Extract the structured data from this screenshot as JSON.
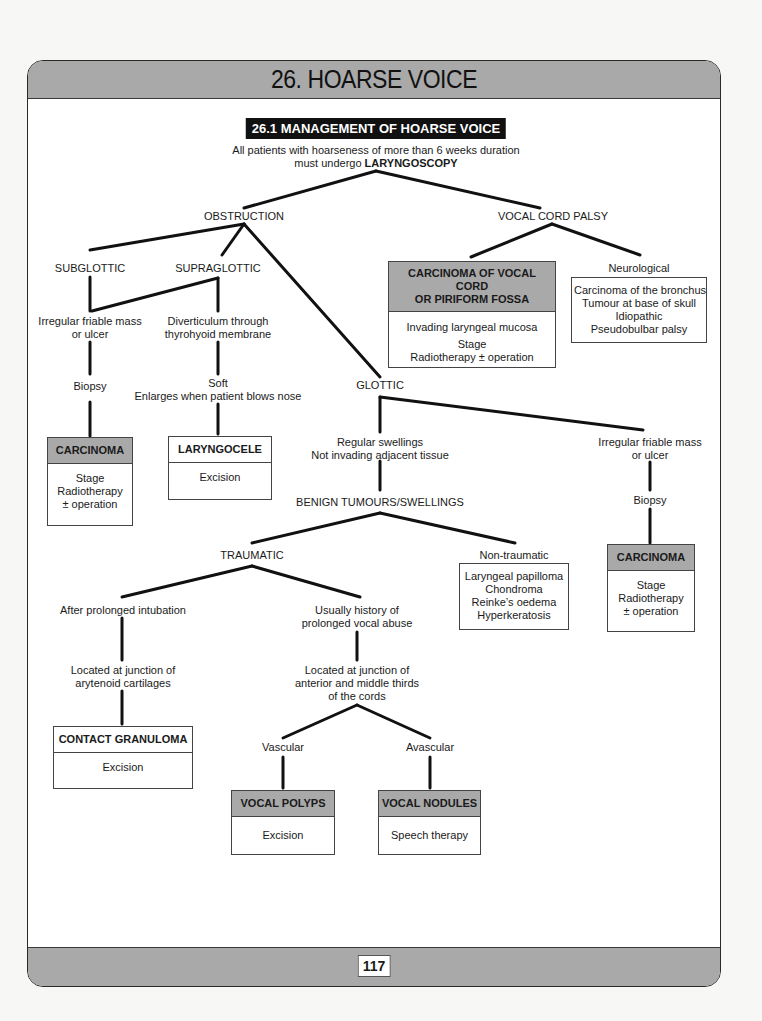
{
  "page": {
    "chapter_title": "26. HOARSE VOICE",
    "page_number": "117"
  },
  "section": {
    "title": "26.1 MANAGEMENT OF HOARSE VOICE",
    "intro_line1": "All patients with hoarseness of more than 6 weeks duration",
    "intro_line2_prefix": "must undergo ",
    "intro_line2_keyword": "LARYNGOSCOPY"
  },
  "nodes": {
    "obstruction": "OBSTRUCTION",
    "vocal_cord_palsy": "VOCAL CORD PALSY",
    "subglottic": "SUBGLOTTIC",
    "supraglottic": "SUPRAGLOTTIC",
    "subglottic_mass": [
      "Irregular friable mass",
      "or ulcer"
    ],
    "subglottic_biopsy": "Biopsy",
    "diverticulum": [
      "Diverticulum through",
      "thyrohyoid membrane"
    ],
    "soft": [
      "Soft",
      "Enlarges when patient blows nose"
    ],
    "glottic": "GLOTTIC",
    "regular_swellings": [
      "Regular swellings",
      "Not invading adjacent tissue"
    ],
    "glottic_mass": [
      "Irregular friable mass",
      "or ulcer"
    ],
    "glottic_biopsy": "Biopsy",
    "benign": "BENIGN TUMOURS/SWELLINGS",
    "traumatic": "TRAUMATIC",
    "non_traumatic": "Non-traumatic",
    "intubation": "After prolonged intubation",
    "vocal_abuse": [
      "Usually history of",
      "prolonged vocal abuse"
    ],
    "arytenoid": [
      "Located at junction of",
      "arytenoid cartilages"
    ],
    "anterior_middle": [
      "Located at junction of",
      "anterior and middle thirds",
      "of the cords"
    ],
    "vascular": "Vascular",
    "avascular": "Avascular",
    "neurological": "Neurological"
  },
  "boxes": {
    "subglottic_carcinoma": {
      "title": "CARCINOMA",
      "lines": [
        "Stage",
        "Radiotherapy",
        "± operation"
      ]
    },
    "laryngocele": {
      "title": "LARYNGOCELE",
      "lines": [
        "Excision"
      ]
    },
    "carcinoma_vocal_cord": {
      "title_line1": "CARCINOMA OF VOCAL CORD",
      "title_line2": "OR PIRIFORM FOSSA",
      "lines": [
        "Invading laryngeal mucosa",
        "Stage",
        "Radiotherapy ± operation"
      ]
    },
    "neurological_causes": {
      "lines": [
        "Carcinoma of the bronchus",
        "Tumour at base of skull",
        "Idiopathic",
        "Pseudobulbar palsy"
      ]
    },
    "non_traumatic_list": {
      "lines": [
        "Laryngeal papilloma",
        "Chondroma",
        "Reinke’s oedema",
        "Hyperkeratosis"
      ]
    },
    "glottic_carcinoma": {
      "title": "CARCINOMA",
      "lines": [
        "Stage",
        "Radiotherapy",
        "± operation"
      ]
    },
    "contact_granuloma": {
      "title": "CONTACT GRANULOMA",
      "lines": [
        "Excision"
      ]
    },
    "vocal_polyps": {
      "title": "VOCAL POLYPS",
      "lines": [
        "Excision"
      ]
    },
    "vocal_nodules": {
      "title": "VOCAL NODULES",
      "lines": [
        "Speech therapy"
      ]
    }
  },
  "colors": {
    "header_grey": "#a9a9a9",
    "title_bar": "#111111",
    "line": "#111111"
  }
}
